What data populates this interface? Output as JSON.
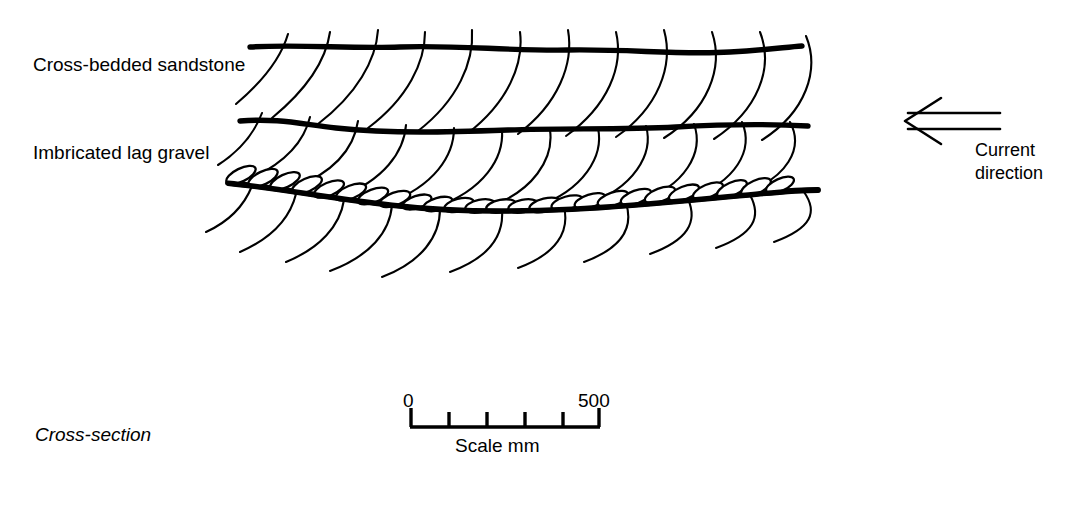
{
  "figure": {
    "caption": "Cross-section",
    "labels": {
      "upper_unit": "Cross-bedded sandstone",
      "lower_unit": "Imbricated lag gravel"
    },
    "flow_indicator": {
      "line1": "Current",
      "line2": "direction",
      "arrow_points": "left",
      "arrow_style": "double-line-open"
    },
    "scale": {
      "min_label": "0",
      "max_label": "500",
      "caption": "Scale mm",
      "units": "mm",
      "tick_count": 6,
      "tick_values": [
        0,
        100,
        200,
        300,
        400,
        500
      ],
      "bar_left_px": 410,
      "bar_right_px": 600
    },
    "colors": {
      "ink": "#000000",
      "background": "#ffffff",
      "clast_fill": "#ffffff"
    },
    "geometry": {
      "bounding_surfaces": 3,
      "foreset_sets": 3,
      "clast_count": 23,
      "imbrication_dip": "upstream (to the left)"
    }
  }
}
